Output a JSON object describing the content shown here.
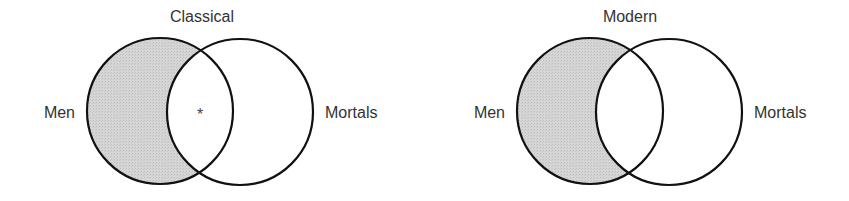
{
  "colors": {
    "shade": "#d2d2d2",
    "stroke": "#111111",
    "text": "#333333"
  },
  "diagrams": [
    {
      "title": "Classical",
      "left_label": "Men",
      "right_label": "Mortals",
      "marker": "*",
      "shaded_region": "Men outside Mortals"
    },
    {
      "title": "Modern",
      "left_label": "Men",
      "right_label": "Mortals",
      "marker": "",
      "shaded_region": "Men outside Mortals"
    }
  ]
}
